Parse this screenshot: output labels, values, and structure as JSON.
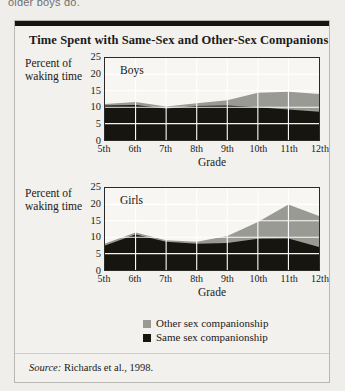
{
  "pretext": "older boys do.",
  "figure": {
    "title": "Time Spent with Same-Sex and Other-Sex Companions",
    "source_prefix": "Source:",
    "source_text": "Richards et al., 1998."
  },
  "legend": {
    "position": "bottom",
    "items": [
      {
        "label": "Other sex companionship",
        "color": "#9a9a95"
      },
      {
        "label": "Same sex companionship",
        "color": "#16150f"
      }
    ]
  },
  "colors": {
    "same_sex": "#16150f",
    "other_sex": "#9a9a95",
    "gridline": "#ffffff",
    "frame": "#2b2a26",
    "panel_bg": "#f7f6f3",
    "figure_bg": "#f2f1ed",
    "page_bg": "#efeeea"
  },
  "chart_data": [
    {
      "type": "area",
      "title": "Boys",
      "stacked": true,
      "xlabel": "Grade",
      "ylabel": "Percent of waking time",
      "categories": [
        "5th",
        "6th",
        "7th",
        "8th",
        "9th",
        "10th",
        "11th",
        "12th"
      ],
      "ylim": [
        0,
        25
      ],
      "yticks": [
        0,
        5,
        10,
        15,
        20,
        25
      ],
      "grid": true,
      "series": [
        {
          "name": "Same sex companionship",
          "color": "#16150f",
          "values": [
            10.5,
            10.7,
            9.6,
            10.4,
            10.5,
            10.0,
            9.3,
            8.6
          ]
        },
        {
          "name": "Other sex companionship",
          "color": "#9a9a95",
          "values": [
            0.5,
            0.9,
            0.6,
            0.8,
            1.6,
            4.4,
            5.4,
            5.4
          ]
        }
      ],
      "totals": [
        11.0,
        11.6,
        10.2,
        11.2,
        12.1,
        14.4,
        14.7,
        14.0
      ]
    },
    {
      "type": "area",
      "title": "Girls",
      "stacked": true,
      "xlabel": "Grade",
      "ylabel": "Percent of waking time",
      "categories": [
        "5th",
        "6th",
        "7th",
        "8th",
        "9th",
        "10th",
        "11th",
        "12th"
      ],
      "ylim": [
        0,
        25
      ],
      "yticks": [
        0,
        5,
        10,
        15,
        20,
        25
      ],
      "grid": true,
      "series": [
        {
          "name": "Same sex companionship",
          "color": "#16150f",
          "values": [
            7.5,
            10.8,
            8.6,
            8.0,
            8.2,
            9.5,
            9.6,
            7.0
          ]
        },
        {
          "name": "Other sex companionship",
          "color": "#9a9a95",
          "values": [
            0.6,
            0.6,
            0.5,
            0.6,
            2.2,
            5.1,
            10.4,
            9.5
          ]
        }
      ],
      "totals": [
        8.1,
        11.4,
        9.1,
        8.6,
        10.4,
        14.6,
        20.0,
        16.5
      ]
    }
  ]
}
